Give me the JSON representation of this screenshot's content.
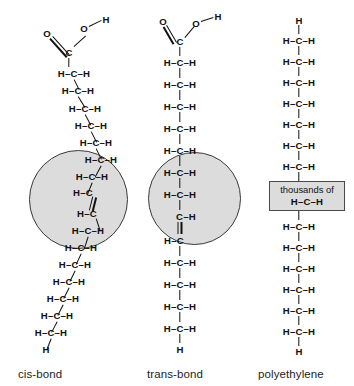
{
  "figure": {
    "background_color": "#ffffff",
    "highlight_fill": "#dcdcdc",
    "highlight_stroke": "#3a3a3a",
    "bond_color": "#111111"
  },
  "captions": {
    "cis": "cis-bond",
    "trans": "trans-bond",
    "polyethylene": "polyethylene"
  },
  "atoms": {
    "H": "H",
    "C": "C",
    "O": "O"
  },
  "units": {
    "ch2": "H–C–H",
    "ch_left": "H–C",
    "ch_right": "C–H",
    "terminal_h": "H"
  },
  "thousands_box": {
    "text": "thousands of",
    "unit": "H–C–H"
  },
  "columns": {
    "cis": {
      "label": "cis-bond",
      "head_group": {
        "o_double": "O",
        "c": "C",
        "o_single": "O",
        "h": "H"
      },
      "chain_above_double_bond": [
        "H–C–H",
        "H–C–H",
        "H–C–H",
        "H–C–H",
        "H–C–H",
        "H–C–H"
      ],
      "double_bond_region": {
        "in_circle": true,
        "upper_carbon": "H–C",
        "lower_carbon": "H–C",
        "bond_type": "double"
      },
      "chain_below_double_bond": [
        "H–C–H",
        "H–C–H",
        "H–C–H",
        "H–C–H",
        "H–C–H",
        "H–C–H",
        "H–C–H"
      ],
      "terminal": "H",
      "geometry": "kinked"
    },
    "trans": {
      "label": "trans-bond",
      "head_group": {
        "o_double": "O",
        "c": "C",
        "o_single": "O",
        "h": "H"
      },
      "chain_above_double_bond": [
        "H–C–H",
        "H–C–H",
        "H–C–H",
        "H–C–H",
        "H–C–H",
        "H–C–H",
        "H–C–H"
      ],
      "double_bond_region": {
        "in_circle": true,
        "upper_carbon": "C–H",
        "lower_carbon": "H–C",
        "bond_type": "double"
      },
      "chain_below_double_bond": [
        "H–C–H",
        "H–C–H",
        "H–C–H",
        "H–C–H",
        "H–C–H",
        "H–C–H",
        "H–C–H"
      ],
      "terminal": "H",
      "geometry": "straight"
    },
    "polyethylene": {
      "label": "polyethylene",
      "terminal_top": "H",
      "chain_above_box": [
        "H–C–H",
        "H–C–H",
        "H–C–H",
        "H–C–H",
        "H–C–H",
        "H–C–H",
        "H–C–H",
        "H–C–H"
      ],
      "repeat_note": "thousands of",
      "repeat_unit": "H–C–H",
      "chain_below_box": [
        "H–C–H",
        "H–C–H",
        "H–C–H",
        "H–C–H",
        "H–C–H",
        "H–C–H",
        "H–C–H"
      ],
      "terminal_bottom": "H",
      "geometry": "straight"
    }
  }
}
